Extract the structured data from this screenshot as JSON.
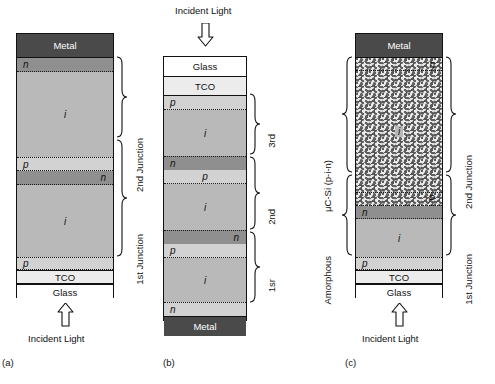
{
  "figure": {
    "background": "#ffffff",
    "colors": {
      "metal": "#4a4a4a",
      "glass": "#ffffff",
      "tco": "#ececec",
      "i_layer": "#b9b9b9",
      "n_layer": "#8f8f8f",
      "p_layer": "#d2d2d2",
      "microcrystalline": "#b3b3b3",
      "outline": "#111111"
    },
    "labels": {
      "incident_light": "Incident Light",
      "metal": "Metal",
      "glass": "Glass",
      "tco": "TCO",
      "n": "n",
      "p": "p",
      "i": "i",
      "p_upper": "p",
      "P_upper": "P"
    }
  },
  "panels": [
    {
      "id": "a",
      "caption": "(a)",
      "incident_light_label": "Incident Light",
      "incident_light_position": "bottom",
      "layers": [
        {
          "name": "Metal",
          "type": "metal",
          "label": "Metal",
          "align": "center"
        },
        {
          "name": "n",
          "type": "n",
          "label": "n",
          "align": "left"
        },
        {
          "name": "i",
          "type": "i",
          "label": "i",
          "align": "center"
        },
        {
          "name": "p",
          "type": "p",
          "label": "p",
          "align": "left"
        },
        {
          "name": "n",
          "type": "n",
          "label": "n",
          "align": "right"
        },
        {
          "name": "i",
          "type": "i",
          "label": "i",
          "align": "center"
        },
        {
          "name": "p",
          "type": "p",
          "label": "p",
          "align": "left"
        },
        {
          "name": "TCO",
          "type": "tco",
          "label": "TCO",
          "align": "center"
        },
        {
          "name": "Glass",
          "type": "glass",
          "label": "Glass",
          "align": "center"
        }
      ],
      "braces": [
        {
          "label": "2nd Junction",
          "side": "right"
        },
        {
          "label": "1st Junction",
          "side": "right"
        }
      ]
    },
    {
      "id": "b",
      "caption": "(b)",
      "incident_light_label": "Incident Light",
      "incident_light_position": "top",
      "layers": [
        {
          "name": "Glass",
          "type": "glass",
          "label": "Glass",
          "align": "center"
        },
        {
          "name": "TCO",
          "type": "tco",
          "label": "TCO",
          "align": "center"
        },
        {
          "name": "p",
          "type": "p",
          "label": "p",
          "align": "left"
        },
        {
          "name": "i",
          "type": "i",
          "label": "i",
          "align": "center"
        },
        {
          "name": "n",
          "type": "n",
          "label": "n",
          "align": "left"
        },
        {
          "name": "p",
          "type": "p",
          "label": "p",
          "align": "center"
        },
        {
          "name": "i",
          "type": "i",
          "label": "i",
          "align": "center"
        },
        {
          "name": "n",
          "type": "n",
          "label": "n",
          "align": "right"
        },
        {
          "name": "p",
          "type": "p",
          "label": "p",
          "align": "left"
        },
        {
          "name": "i",
          "type": "i",
          "label": "i",
          "align": "center"
        },
        {
          "name": "n",
          "type": "n",
          "label": "n",
          "align": "left"
        },
        {
          "name": "Metal",
          "type": "metal",
          "label": "Metal",
          "align": "center"
        }
      ],
      "braces": [
        {
          "label": "3rd",
          "side": "right"
        },
        {
          "label": "2nd",
          "side": "right"
        },
        {
          "label": "1sr",
          "side": "right"
        }
      ]
    },
    {
      "id": "c",
      "caption": "(c)",
      "incident_light_label": "Incident Light",
      "incident_light_position": "bottom",
      "layers": [
        {
          "name": "Metal",
          "type": "metal",
          "label": "Metal",
          "align": "center"
        },
        {
          "name": "n",
          "type": "microcrystalline-n",
          "label": "n",
          "align": "right"
        },
        {
          "name": "i",
          "type": "microcrystalline-i",
          "label": "i",
          "align": "center"
        },
        {
          "name": "P",
          "type": "microcrystalline-p",
          "label": "P",
          "align": "right"
        },
        {
          "name": "n",
          "type": "n",
          "label": "n",
          "align": "left"
        },
        {
          "name": "i",
          "type": "i",
          "label": "i",
          "align": "center"
        },
        {
          "name": "p",
          "type": "p",
          "label": "p",
          "align": "left"
        },
        {
          "name": "TCO",
          "type": "tco",
          "label": "TCO",
          "align": "center"
        },
        {
          "name": "Glass",
          "type": "glass",
          "label": "Glass",
          "align": "center"
        }
      ],
      "braces_right": [
        {
          "label": "2nd Junction"
        },
        {
          "label": "1st Junction"
        }
      ],
      "braces_left": [
        {
          "label": "μC-Si (p-i-n)"
        },
        {
          "label": "Amorphous"
        }
      ]
    }
  ]
}
